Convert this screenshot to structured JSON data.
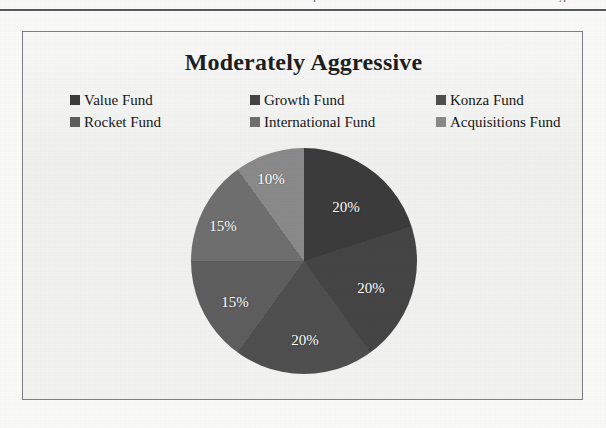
{
  "page": {
    "background_color": "#fbfbfa",
    "header_rule_color": "#55585c",
    "header_fragments": [
      {
        "text": "p",
        "left": 313
      },
      {
        "text": "g",
        "left": 559
      }
    ]
  },
  "chart_frame": {
    "border_color": "#7d8084",
    "background_color": "#f2f2f1"
  },
  "chart_data": {
    "type": "pie",
    "title": "Moderately Aggressive",
    "xlabel": "",
    "ylabel": "",
    "legend_position": "top",
    "grid": false,
    "labels_format": "percent",
    "categories": [
      "Value Fund",
      "Growth Fund",
      "Konza Fund",
      "Rocket Fund",
      "International Fund",
      "Acquisitions Fund"
    ],
    "values": [
      20,
      20,
      20,
      15,
      15,
      10
    ],
    "value_labels": [
      "20%",
      "20%",
      "20%",
      "15%",
      "15%",
      "10%"
    ],
    "colors": [
      "#3b3b3b",
      "#454545",
      "#4f4f4f",
      "#5e5e5e",
      "#6f6f6f",
      "#8a8a8a"
    ],
    "start_angle_deg": 0,
    "direction": "clockwise",
    "slice_label_color": "#ffffff"
  },
  "legend": {
    "rows": [
      [
        {
          "label": "Value Fund",
          "color": "#3b3b3b"
        },
        {
          "label": "Growth Fund",
          "color": "#454545"
        },
        {
          "label": "Konza Fund",
          "color": "#4f4f4f"
        }
      ],
      [
        {
          "label": "Rocket Fund",
          "color": "#5e5e5e"
        },
        {
          "label": "International Fund",
          "color": "#6f6f6f"
        },
        {
          "label": "Acquisitions Fund",
          "color": "#8a8a8a"
        }
      ]
    ]
  },
  "slice_labels": [
    {
      "text": "20%",
      "x": 155,
      "y": 59
    },
    {
      "text": "20%",
      "x": 180,
      "y": 140
    },
    {
      "text": "20%",
      "x": 114,
      "y": 192
    },
    {
      "text": "15%",
      "x": 44,
      "y": 154
    },
    {
      "text": "15%",
      "x": 32,
      "y": 78
    },
    {
      "text": "10%",
      "x": 80,
      "y": 31
    }
  ]
}
